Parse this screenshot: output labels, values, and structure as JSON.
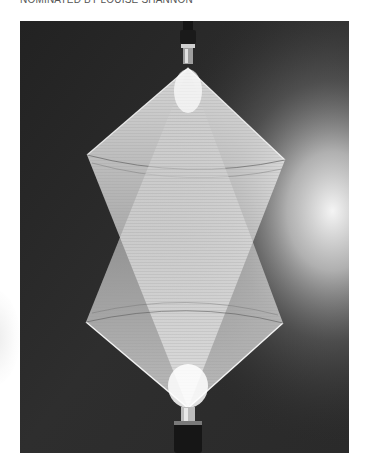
{
  "caption": {
    "text": "NOMINATED BY LOUISE SHANNON"
  },
  "photo": {
    "subject": "suspended double-cone string/thread sculpture lit against dark background",
    "description": "Two interpenetrating cones of taut white threads strung between a top and bottom metal mount, forming a diamond/hourglass-like silhouette; bright light glow from the right",
    "colors": {
      "background_dark": "#262626",
      "background_mid": "#3a3a3a",
      "threads": "#f2f2f2",
      "glow": "#ffffff",
      "mount_dark": "#1a1a1a",
      "mount_metal": "#bdbdbd"
    }
  }
}
